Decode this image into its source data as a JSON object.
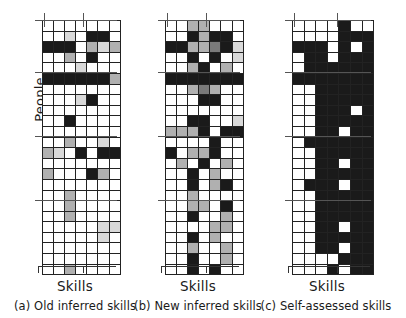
{
  "figure": {
    "y_axis_label": "People",
    "panels": [
      {
        "id": "a",
        "x_axis_label": "Skills",
        "caption": "(a) Old inferred skills"
      },
      {
        "id": "b",
        "x_axis_label": "Skills",
        "caption": "(b) New inferred skills"
      },
      {
        "id": "c",
        "x_axis_label": "Skills",
        "caption": "(c) Self-assessed skills"
      }
    ]
  },
  "chart_data": {
    "type": "heatmap",
    "title": "",
    "xlabel": "Skills",
    "ylabel": "People",
    "grid": true,
    "legend": "none",
    "colorscale": {
      "0": "#ffffff",
      "1": "#d9d9d9",
      "2": "#b0b0b0",
      "3": "#7a7a7a",
      "4": "#1a1a1a"
    },
    "rows": 24,
    "cols": 7,
    "panels": [
      {
        "name": "Old inferred skills",
        "caption": "(a) Old inferred skills",
        "values": [
          [
            0,
            0,
            0,
            0,
            0,
            0,
            0
          ],
          [
            0,
            0,
            1,
            0,
            4,
            4,
            0
          ],
          [
            4,
            4,
            4,
            0,
            2,
            1,
            2
          ],
          [
            0,
            0,
            2,
            0,
            4,
            0,
            0
          ],
          [
            0,
            0,
            0,
            1,
            0,
            0,
            0
          ],
          [
            4,
            4,
            4,
            4,
            4,
            4,
            2
          ],
          [
            0,
            0,
            0,
            0,
            0,
            0,
            0
          ],
          [
            0,
            0,
            0,
            1,
            4,
            0,
            0
          ],
          [
            0,
            0,
            0,
            0,
            0,
            0,
            0
          ],
          [
            0,
            0,
            4,
            0,
            0,
            0,
            0
          ],
          [
            0,
            0,
            0,
            0,
            0,
            0,
            0
          ],
          [
            0,
            0,
            2,
            0,
            0,
            1,
            0
          ],
          [
            2,
            1,
            0,
            4,
            0,
            4,
            4
          ],
          [
            0,
            0,
            0,
            0,
            0,
            0,
            0
          ],
          [
            2,
            0,
            0,
            0,
            4,
            2,
            0
          ],
          [
            0,
            0,
            0,
            0,
            0,
            0,
            0
          ],
          [
            0,
            0,
            2,
            0,
            0,
            0,
            0
          ],
          [
            0,
            0,
            2,
            0,
            0,
            0,
            0
          ],
          [
            0,
            0,
            2,
            0,
            0,
            0,
            0
          ],
          [
            0,
            0,
            0,
            0,
            0,
            1,
            1
          ],
          [
            0,
            0,
            0,
            0,
            0,
            1,
            0
          ],
          [
            0,
            0,
            0,
            0,
            0,
            0,
            0
          ],
          [
            0,
            0,
            0,
            0,
            0,
            0,
            0
          ],
          [
            0,
            0,
            2,
            0,
            0,
            0,
            0
          ]
        ]
      },
      {
        "name": "New inferred skills",
        "caption": "(b) New inferred skills",
        "values": [
          [
            0,
            0,
            2,
            2,
            0,
            0,
            0
          ],
          [
            0,
            0,
            4,
            2,
            4,
            4,
            0
          ],
          [
            4,
            4,
            2,
            2,
            3,
            4,
            1
          ],
          [
            0,
            0,
            4,
            0,
            4,
            0,
            1
          ],
          [
            0,
            0,
            2,
            4,
            0,
            2,
            0
          ],
          [
            4,
            4,
            4,
            4,
            4,
            4,
            4
          ],
          [
            0,
            0,
            2,
            3,
            2,
            0,
            0
          ],
          [
            0,
            0,
            0,
            4,
            4,
            0,
            0
          ],
          [
            0,
            0,
            0,
            0,
            0,
            0,
            0
          ],
          [
            0,
            0,
            4,
            4,
            0,
            0,
            1
          ],
          [
            2,
            2,
            2,
            4,
            0,
            4,
            4
          ],
          [
            0,
            0,
            0,
            0,
            4,
            0,
            0
          ],
          [
            4,
            0,
            2,
            2,
            4,
            0,
            0
          ],
          [
            0,
            2,
            0,
            4,
            0,
            2,
            0
          ],
          [
            0,
            0,
            4,
            0,
            2,
            0,
            0
          ],
          [
            0,
            0,
            4,
            0,
            2,
            4,
            0
          ],
          [
            0,
            0,
            2,
            0,
            0,
            0,
            0
          ],
          [
            0,
            0,
            2,
            2,
            0,
            4,
            0
          ],
          [
            0,
            0,
            4,
            0,
            0,
            2,
            0
          ],
          [
            0,
            0,
            0,
            0,
            2,
            2,
            0
          ],
          [
            0,
            0,
            4,
            0,
            2,
            0,
            0
          ],
          [
            0,
            0,
            2,
            0,
            0,
            2,
            0
          ],
          [
            0,
            0,
            4,
            0,
            0,
            2,
            0
          ],
          [
            0,
            0,
            4,
            0,
            4,
            0,
            0
          ]
        ]
      },
      {
        "name": "Self-assessed skills",
        "caption": "(c) Self-assessed skills",
        "values": [
          [
            0,
            0,
            0,
            0,
            4,
            0,
            0
          ],
          [
            0,
            0,
            0,
            0,
            4,
            4,
            4
          ],
          [
            4,
            4,
            4,
            0,
            4,
            0,
            4
          ],
          [
            0,
            4,
            4,
            0,
            4,
            4,
            4
          ],
          [
            0,
            4,
            4,
            4,
            4,
            4,
            4
          ],
          [
            4,
            4,
            4,
            4,
            4,
            4,
            4
          ],
          [
            0,
            0,
            4,
            4,
            4,
            4,
            4
          ],
          [
            0,
            0,
            4,
            4,
            4,
            4,
            4
          ],
          [
            0,
            0,
            4,
            4,
            4,
            0,
            4
          ],
          [
            0,
            0,
            4,
            4,
            4,
            4,
            4
          ],
          [
            0,
            0,
            4,
            4,
            0,
            4,
            4
          ],
          [
            0,
            4,
            4,
            4,
            4,
            4,
            4
          ],
          [
            0,
            0,
            4,
            4,
            4,
            4,
            4
          ],
          [
            0,
            0,
            4,
            4,
            0,
            4,
            4
          ],
          [
            0,
            0,
            4,
            4,
            4,
            4,
            4
          ],
          [
            0,
            4,
            4,
            4,
            0,
            4,
            4
          ],
          [
            0,
            0,
            4,
            4,
            4,
            4,
            4
          ],
          [
            0,
            0,
            4,
            4,
            4,
            4,
            4
          ],
          [
            0,
            0,
            4,
            4,
            4,
            4,
            4
          ],
          [
            0,
            0,
            4,
            4,
            0,
            4,
            4
          ],
          [
            0,
            0,
            4,
            4,
            4,
            4,
            4
          ],
          [
            0,
            0,
            4,
            4,
            0,
            4,
            4
          ],
          [
            0,
            0,
            0,
            0,
            4,
            4,
            4
          ],
          [
            0,
            0,
            0,
            4,
            0,
            4,
            4
          ]
        ]
      }
    ]
  }
}
